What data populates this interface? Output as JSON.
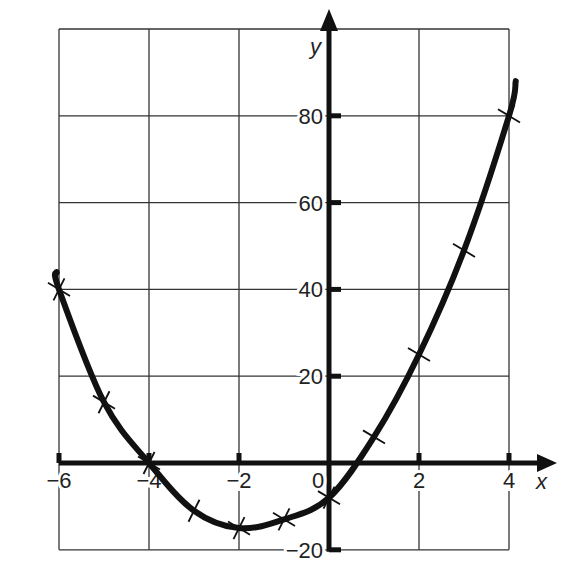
{
  "chart_data": {
    "type": "line",
    "title": "",
    "xlabel": "x",
    "ylabel": "y",
    "xlim": [
      -6,
      4
    ],
    "ylim": [
      -20,
      90
    ],
    "grid": true,
    "x_ticks": [
      -6,
      -4,
      -2,
      0,
      2,
      4
    ],
    "x_tick_labels": [
      "−6",
      "−4",
      "−2",
      "0",
      "2",
      "4"
    ],
    "y_ticks": [
      -20,
      20,
      40,
      60,
      80
    ],
    "y_tick_labels": [
      "−20",
      "20",
      "40",
      "60",
      "80"
    ],
    "series": [
      {
        "name": "curve",
        "style": "smooth curve with cross markers",
        "x": [
          -6,
          -5,
          -4,
          -3,
          -2,
          -1,
          0,
          1,
          2,
          3,
          4
        ],
        "y": [
          40,
          14,
          0,
          -11,
          -15,
          -13,
          -8,
          6,
          25,
          49,
          80
        ]
      }
    ]
  }
}
